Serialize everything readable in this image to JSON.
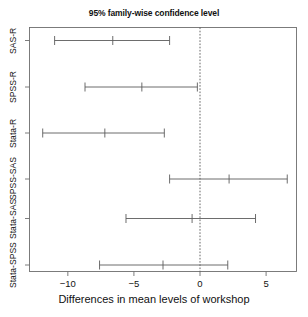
{
  "chart_data": {
    "type": "scatter",
    "title": "95% family-wise confidence level",
    "xlabel": "Differences in mean levels of workshop",
    "ylabel": "",
    "xlim": [
      -12.9,
      7.3
    ],
    "ylim": [
      0,
      6
    ],
    "grid": false,
    "legend": null,
    "reference_line": {
      "x": 0,
      "style": "dotted"
    },
    "xticks": [
      -10,
      -5,
      0,
      5
    ],
    "xtick_labels": [
      "−10",
      "−5",
      "0",
      "5"
    ],
    "categories": [
      "SAS-R",
      "SPSS-R",
      "Stata-R",
      "SPSS-SAS",
      "Stata-SAS",
      "Stata-SPSS"
    ],
    "series": [
      {
        "name": "difference in mean levels",
        "points": [
          {
            "category": "SAS-R",
            "estimate": -6.6,
            "lower": -11.0,
            "upper": -2.3
          },
          {
            "category": "SPSS-R",
            "estimate": -4.4,
            "lower": -8.7,
            "upper": -0.2
          },
          {
            "category": "Stata-R",
            "estimate": -7.2,
            "lower": -11.9,
            "upper": -2.7
          },
          {
            "category": "SPSS-SAS",
            "estimate": 2.2,
            "lower": -2.3,
            "upper": 6.6
          },
          {
            "category": "Stata-SAS",
            "estimate": -0.6,
            "lower": -5.6,
            "upper": 4.2
          },
          {
            "category": "Stata-SPSS",
            "estimate": -2.8,
            "lower": -7.6,
            "upper": 2.1
          }
        ]
      }
    ],
    "colors": {
      "line": "#5c5c5c",
      "axis": "#6e6e6e",
      "text": "#111111",
      "background": "#ffffff"
    }
  }
}
